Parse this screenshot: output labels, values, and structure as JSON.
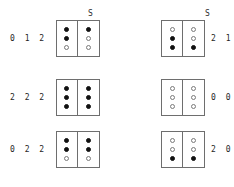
{
  "diagram": {
    "type": "two-column-dot-matrix-pairs",
    "symbols": {
      "filled": "●",
      "empty": "○"
    },
    "groups": [
      {
        "id": "left-group",
        "header": "S",
        "label_side": "left",
        "rows": [
          {
            "code": "0 1 2",
            "columns": [
              {
                "dots": [
                  "filled",
                  "filled",
                  "empty"
                ]
              },
              {
                "dots": [
                  "filled",
                  "empty",
                  "empty"
                ]
              }
            ]
          },
          {
            "code": "2 2 2",
            "columns": [
              {
                "dots": [
                  "filled",
                  "filled",
                  "filled"
                ]
              },
              {
                "dots": [
                  "filled",
                  "filled",
                  "filled"
                ]
              }
            ]
          },
          {
            "code": "0 2 2",
            "columns": [
              {
                "dots": [
                  "filled",
                  "filled",
                  "empty"
                ]
              },
              {
                "dots": [
                  "filled",
                  "filled",
                  "empty"
                ]
              }
            ]
          }
        ]
      },
      {
        "id": "right-group",
        "header": "S",
        "label_side": "right",
        "rows": [
          {
            "code": "2 1 0",
            "columns": [
              {
                "dots": [
                  "empty",
                  "filled",
                  "filled"
                ]
              },
              {
                "dots": [
                  "empty",
                  "empty",
                  "filled"
                ]
              }
            ]
          },
          {
            "code": "0 0 0",
            "columns": [
              {
                "dots": [
                  "empty",
                  "empty",
                  "empty"
                ]
              },
              {
                "dots": [
                  "empty",
                  "empty",
                  "empty"
                ]
              }
            ]
          },
          {
            "code": "2 0 0",
            "columns": [
              {
                "dots": [
                  "empty",
                  "empty",
                  "filled"
                ]
              },
              {
                "dots": [
                  "empty",
                  "empty",
                  "filled"
                ]
              }
            ]
          }
        ]
      }
    ]
  },
  "colors": {
    "background": "#ffffff",
    "stroke": "#6e6e6e",
    "dot_filled": "#111111",
    "dot_empty_border": "#7a7a7a",
    "text": "#1f1f1f"
  }
}
